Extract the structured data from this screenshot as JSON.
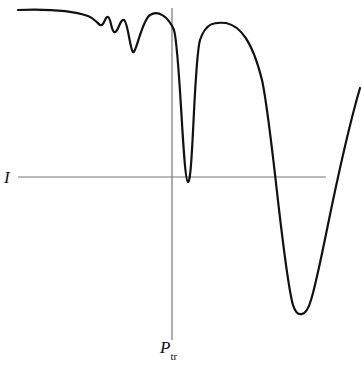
{
  "diagram": {
    "horizontal_line_label": "I",
    "vertical_line_label_main": "P",
    "vertical_line_label_sub": "tr",
    "colors": {
      "curve": "#111111",
      "axis_lines": "#777777",
      "background": "#ffffff"
    },
    "curve_path": "M18,10 C45,9 70,10 88,16 C94,18 96,22 100,25 C104,27 105,16 108,17 C111,18 111,30 114,32 C118,34 120,18 124,20 C128,22 130,50 133,52 C136,54 142,20 150,15 C158,10 168,16 174,30 C180,50 183,181 188,182 C193,183 194,60 200,40 C206,22 215,22 226,23 C240,26 252,40 262,80 C272,125 283,270 293,305 C297,318 306,318 311,300 C322,265 336,170 360,88",
    "horizontal_line": {
      "x1": 18,
      "y1": 177,
      "x2": 326,
      "y2": 177
    },
    "vertical_line": {
      "x1": 172,
      "y1": 8,
      "x2": 172,
      "y2": 340
    }
  }
}
